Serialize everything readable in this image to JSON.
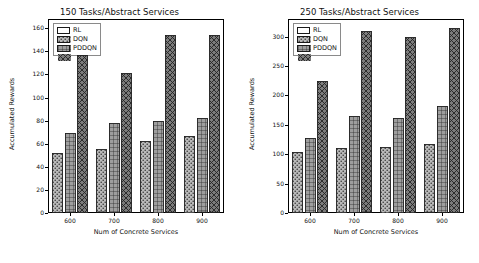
{
  "chart_data": [
    {
      "type": "bar",
      "title": "150 Tasks/Abstract Services",
      "xlabel": "Num of Concrete Services",
      "ylabel": "Accumulated Rewards",
      "categories": [
        "600",
        "700",
        "800",
        "900"
      ],
      "yticks": [
        0,
        20,
        40,
        60,
        80,
        100,
        120,
        140,
        160
      ],
      "ylim": [
        0,
        168
      ],
      "grid": false,
      "legend_position": "upper left",
      "series": [
        {
          "name": "RL",
          "values": [
            52,
            55,
            62,
            67
          ],
          "fill": "#b4b4b4",
          "hatch": "dots"
        },
        {
          "name": "DQN",
          "values": [
            69,
            78,
            80,
            82
          ],
          "fill": "#9a9a9a",
          "hatch": "grid"
        },
        {
          "name": "PDDQN",
          "values": [
            137,
            121,
            154,
            154
          ],
          "fill": "#777777",
          "hatch": "cross"
        }
      ]
    },
    {
      "type": "bar",
      "title": "250 Tasks/Abstract Services",
      "xlabel": "Num of Concrete Services",
      "ylabel": "Accumulated Rewards",
      "categories": [
        "600",
        "700",
        "800",
        "900"
      ],
      "yticks": [
        0,
        50,
        100,
        150,
        200,
        250,
        300
      ],
      "ylim": [
        0,
        330
      ],
      "grid": false,
      "legend_position": "upper left",
      "series": [
        {
          "name": "RL",
          "values": [
            104,
            111,
            113,
            117
          ],
          "fill": "#b4b4b4",
          "hatch": "dots"
        },
        {
          "name": "DQN",
          "values": [
            128,
            165,
            162,
            182
          ],
          "fill": "#9a9a9a",
          "hatch": "grid"
        },
        {
          "name": "PDDQN",
          "values": [
            225,
            309,
            300,
            315
          ],
          "fill": "#777777",
          "hatch": "cross"
        }
      ]
    }
  ],
  "legend": {
    "labels": [
      "RL",
      "DQN",
      "PDDQN"
    ]
  }
}
